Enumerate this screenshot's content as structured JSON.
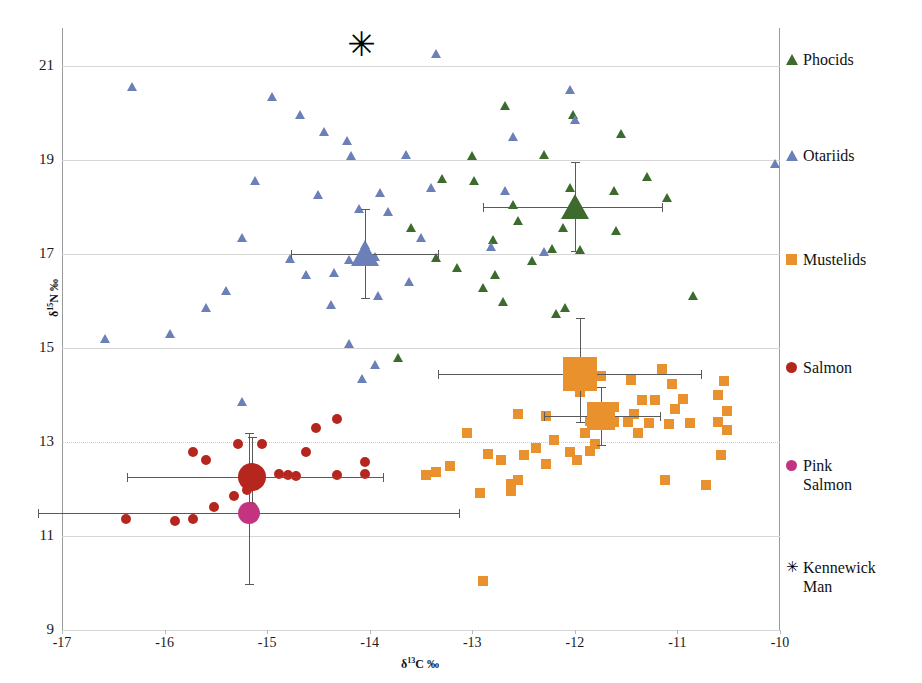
{
  "chart_data": {
    "type": "scatter",
    "title": "",
    "xlabel": "δ13C ‰",
    "ylabel": "δ15N ‰",
    "xlabel_parts": {
      "pre": "δ",
      "sup": "13",
      "post": "C ‰"
    },
    "ylabel_parts": {
      "pre": "δ",
      "sup": "15",
      "post": "N ‰"
    },
    "xlim": [
      -17,
      -10
    ],
    "ylim": [
      9,
      21.8
    ],
    "xticks": [
      -17,
      -16,
      -15,
      -14,
      -13,
      -12,
      -11,
      -10
    ],
    "xtick_labels": [
      "-17",
      "-16",
      "-15",
      "-14",
      "-13",
      "-12",
      "-11",
      "-10"
    ],
    "yticks": [
      9,
      11,
      13,
      15,
      17,
      19,
      21
    ],
    "ytick_labels": [
      "9",
      "11",
      "13",
      "15",
      "17",
      "19",
      "21"
    ],
    "grid": "horizontal",
    "legend_position": "right",
    "colors": {
      "phocids": "#3d6b2e",
      "otariids": "#6b80b8",
      "mustelids": "#e8912d",
      "salmon": "#b5271e",
      "pink_salmon": "#c4337f",
      "kennewick": "#000000",
      "errorbar": "#595959",
      "grid": "#d6d6d6",
      "axis": "#9a9a9a"
    },
    "series": [
      {
        "name": "Phocids",
        "marker": "triangle",
        "color": "#3d6b2e",
        "points": [
          [
            -12.68,
            20.15
          ],
          [
            -12.02,
            19.95
          ],
          [
            -11.55,
            19.55
          ],
          [
            -12.3,
            19.1
          ],
          [
            -13.0,
            19.08
          ],
          [
            -12.98,
            18.55
          ],
          [
            -11.3,
            18.65
          ],
          [
            -11.62,
            18.35
          ],
          [
            -12.05,
            18.4
          ],
          [
            -11.1,
            18.2
          ],
          [
            -12.55,
            17.7
          ],
          [
            -12.12,
            17.55
          ],
          [
            -11.6,
            17.5
          ],
          [
            -12.8,
            17.3
          ],
          [
            -12.22,
            17.12
          ],
          [
            -11.95,
            17.08
          ],
          [
            -12.42,
            16.85
          ],
          [
            -13.35,
            16.92
          ],
          [
            -13.15,
            16.7
          ],
          [
            -12.78,
            16.55
          ],
          [
            -12.9,
            16.28
          ],
          [
            -12.7,
            15.98
          ],
          [
            -12.1,
            15.85
          ],
          [
            -12.18,
            15.72
          ],
          [
            -10.85,
            16.1
          ],
          [
            -13.6,
            17.55
          ],
          [
            -13.72,
            14.8
          ],
          [
            -13.3,
            18.6
          ],
          [
            -12.6,
            18.05
          ],
          [
            -12.0,
            17.9
          ]
        ],
        "mean": {
          "x": -12.0,
          "y": 18.0,
          "xerr": [
            0.9,
            0.85
          ],
          "yerr": [
            0.95,
            0.95
          ]
        }
      },
      {
        "name": "Otariids",
        "marker": "triangle",
        "color": "#6b80b8",
        "points": [
          [
            -16.32,
            20.55
          ],
          [
            -14.95,
            20.35
          ],
          [
            -13.35,
            21.25
          ],
          [
            -14.68,
            19.95
          ],
          [
            -14.45,
            19.6
          ],
          [
            -14.22,
            19.4
          ],
          [
            -14.18,
            19.08
          ],
          [
            -13.65,
            19.1
          ],
          [
            -12.6,
            19.5
          ],
          [
            -12.05,
            20.5
          ],
          [
            -12.0,
            19.85
          ],
          [
            -10.05,
            18.92
          ],
          [
            -15.12,
            18.55
          ],
          [
            -14.5,
            18.25
          ],
          [
            -13.9,
            18.3
          ],
          [
            -13.4,
            18.4
          ],
          [
            -12.68,
            18.35
          ],
          [
            -14.1,
            17.95
          ],
          [
            -13.82,
            17.9
          ],
          [
            -15.25,
            17.35
          ],
          [
            -14.05,
            17.2
          ],
          [
            -13.95,
            16.95
          ],
          [
            -14.78,
            16.9
          ],
          [
            -14.62,
            16.55
          ],
          [
            -14.35,
            16.6
          ],
          [
            -13.62,
            16.4
          ],
          [
            -13.92,
            16.1
          ],
          [
            -15.4,
            16.22
          ],
          [
            -15.95,
            15.3
          ],
          [
            -14.2,
            16.88
          ],
          [
            -14.38,
            15.92
          ],
          [
            -16.58,
            15.2
          ],
          [
            -15.6,
            15.85
          ],
          [
            -14.2,
            15.1
          ],
          [
            -13.95,
            14.65
          ],
          [
            -14.08,
            14.35
          ],
          [
            -15.25,
            13.85
          ],
          [
            -12.82,
            17.15
          ],
          [
            -12.3,
            17.05
          ],
          [
            -13.5,
            17.35
          ]
        ],
        "mean": {
          "x": -14.05,
          "y": 17.0,
          "xerr": [
            0.72,
            0.72
          ],
          "yerr": [
            0.95,
            0.95
          ]
        }
      },
      {
        "name": "Mustelids",
        "marker": "square",
        "color": "#e8912d",
        "points": [
          [
            -11.15,
            14.55
          ],
          [
            -11.75,
            14.4
          ],
          [
            -11.45,
            14.32
          ],
          [
            -11.05,
            14.22
          ],
          [
            -10.55,
            14.3
          ],
          [
            -10.6,
            14.0
          ],
          [
            -11.95,
            14.05
          ],
          [
            -11.35,
            13.9
          ],
          [
            -11.22,
            13.88
          ],
          [
            -10.95,
            13.92
          ],
          [
            -11.02,
            13.7
          ],
          [
            -10.52,
            13.65
          ],
          [
            -11.62,
            13.75
          ],
          [
            -11.42,
            13.6
          ],
          [
            -12.55,
            13.6
          ],
          [
            -12.28,
            13.55
          ],
          [
            -11.85,
            13.45
          ],
          [
            -11.62,
            13.42
          ],
          [
            -11.48,
            13.42
          ],
          [
            -11.28,
            13.4
          ],
          [
            -11.08,
            13.38
          ],
          [
            -10.88,
            13.4
          ],
          [
            -10.6,
            13.42
          ],
          [
            -10.52,
            13.25
          ],
          [
            -11.38,
            13.18
          ],
          [
            -11.9,
            13.18
          ],
          [
            -11.8,
            12.95
          ],
          [
            -11.85,
            12.8
          ],
          [
            -12.2,
            13.05
          ],
          [
            -12.38,
            12.88
          ],
          [
            -12.05,
            12.78
          ],
          [
            -12.5,
            12.72
          ],
          [
            -11.98,
            12.62
          ],
          [
            -12.28,
            12.52
          ],
          [
            -10.58,
            12.72
          ],
          [
            -13.05,
            13.18
          ],
          [
            -12.85,
            12.75
          ],
          [
            -12.72,
            12.62
          ],
          [
            -13.35,
            12.35
          ],
          [
            -12.55,
            12.18
          ],
          [
            -12.62,
            12.1
          ],
          [
            -12.62,
            11.95
          ],
          [
            -11.12,
            12.18
          ],
          [
            -10.72,
            12.08
          ],
          [
            -13.45,
            12.3
          ],
          [
            -13.22,
            12.48
          ],
          [
            -12.92,
            11.92
          ],
          [
            -12.9,
            10.05
          ]
        ],
        "mean": {
          "x": -11.75,
          "y": 13.55,
          "xerr": [
            0.55,
            0.58
          ],
          "yerr": [
            0.62,
            0.62
          ]
        },
        "mean2": {
          "x": -11.95,
          "y": 14.45,
          "xerr": [
            1.38,
            1.18
          ],
          "yerr": [
            1.18,
            1.02
          ]
        }
      },
      {
        "name": "Salmon",
        "marker": "circle",
        "color": "#b5271e",
        "points": [
          [
            -15.28,
            12.95
          ],
          [
            -15.05,
            12.95
          ],
          [
            -14.52,
            13.3
          ],
          [
            -14.32,
            13.48
          ],
          [
            -14.62,
            12.78
          ],
          [
            -15.72,
            12.78
          ],
          [
            -15.6,
            12.62
          ],
          [
            -14.05,
            12.58
          ],
          [
            -14.88,
            12.32
          ],
          [
            -14.72,
            12.28
          ],
          [
            -14.8,
            12.3
          ],
          [
            -14.32,
            12.3
          ],
          [
            -14.05,
            12.32
          ],
          [
            -15.18,
            12.22
          ],
          [
            -15.2,
            11.98
          ],
          [
            -15.32,
            11.85
          ],
          [
            -15.52,
            11.62
          ],
          [
            -16.38,
            11.35
          ],
          [
            -15.9,
            11.32
          ],
          [
            -15.72,
            11.35
          ],
          [
            -15.15,
            11.62
          ]
        ],
        "mean": {
          "x": -15.15,
          "y": 12.25,
          "xerr": [
            1.22,
            1.28
          ],
          "yerr": [
            0.85,
            0.92
          ]
        }
      },
      {
        "name": "Pink Salmon",
        "marker": "circle",
        "color": "#c4337f",
        "points": [
          [
            -15.18,
            11.48
          ]
        ],
        "mean": {
          "x": -15.18,
          "y": 11.48,
          "xerr": [
            2.05,
            2.05
          ],
          "yerr": [
            1.7,
            1.5
          ]
        }
      },
      {
        "name": "Kennewick Man",
        "marker": "asterisk",
        "color": "#000000",
        "points": [
          [
            -14.08,
            21.45
          ]
        ]
      }
    ]
  },
  "legend": {
    "items": [
      {
        "label": "Phocids",
        "marker": "triangle",
        "color": "#3d6b2e",
        "top": 22
      },
      {
        "label": "Otariids",
        "marker": "triangle",
        "color": "#6b80b8",
        "top": 118
      },
      {
        "label": "Mustelids",
        "marker": "square",
        "color": "#e8912d",
        "top": 222
      },
      {
        "label": "Salmon",
        "marker": "circle",
        "color": "#b5271e",
        "top": 330
      },
      {
        "label": "Pink\nSalmon",
        "marker": "circle",
        "color": "#c4337f",
        "top": 428
      },
      {
        "label": "Kennewick\nMan",
        "marker": "asterisk",
        "color": "#000000",
        "top": 530
      }
    ]
  }
}
